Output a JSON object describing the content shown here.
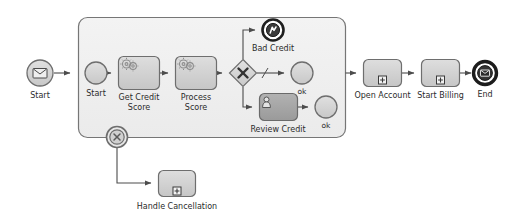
{
  "diagram": {
    "notation": "BPMN",
    "colors": {
      "canvas": "#ffffff",
      "subprocess_fill": "#f0f0f0",
      "task_fill": "#d2d2d2",
      "task_fill_dark": "#a8a8a8",
      "event_fill": "#d4d4d4",
      "stroke": "#6a6a6a",
      "stroke_dark": "#2b2b2b",
      "text": "#2b2b2b",
      "flow": "#5a5a5a"
    }
  },
  "nodes": {
    "start_message": {
      "label": "Start",
      "type": "message-start-event",
      "icon": "envelope-icon",
      "x": 40,
      "y": 73,
      "r": 13
    },
    "subprocess": {
      "label": "",
      "type": "expanded-subprocess",
      "x": 78,
      "y": 17,
      "w": 267,
      "h": 120
    },
    "inner_start": {
      "label": "Start",
      "type": "none-start-event",
      "icon": "circle-icon",
      "x": 96,
      "y": 73,
      "r": 11
    },
    "get_credit_score": {
      "label_line1": "Get Credit",
      "label_line2": "Score",
      "type": "service-task",
      "icon": "gears-icon",
      "x": 118,
      "y": 56,
      "w": 41,
      "h": 34
    },
    "process_score": {
      "label_line1": "Process",
      "label_line2": "Score",
      "type": "service-task",
      "icon": "gears-icon",
      "x": 175,
      "y": 56,
      "w": 41,
      "h": 34
    },
    "gateway": {
      "label": "",
      "type": "exclusive-gateway",
      "icon": "x-icon",
      "x": 243,
      "y": 73,
      "half": 14
    },
    "bad_credit": {
      "label": "Bad Credit",
      "type": "error-end-event",
      "icon": "error-bolt-icon",
      "x": 273,
      "y": 30,
      "r": 11
    },
    "ok_top": {
      "label": "ok",
      "type": "none-end-event",
      "icon": "circle-icon",
      "x": 302,
      "y": 73,
      "r": 11
    },
    "review_credit": {
      "label": "Review Credit",
      "type": "user-task",
      "icon": "user-icon",
      "x": 259,
      "y": 93,
      "w": 38,
      "h": 27
    },
    "ok_bottom": {
      "label": "ok",
      "type": "none-end-event",
      "icon": "circle-icon",
      "x": 326,
      "y": 107,
      "r": 11
    },
    "boundary_cancel": {
      "label": "",
      "type": "cancel-boundary-event",
      "icon": "cancel-x-icon",
      "x": 117,
      "y": 137,
      "r": 11
    },
    "handle_cancellation": {
      "label": "Handle Cancellation",
      "type": "collapsed-subprocess",
      "icon": "plus-marker-icon",
      "x": 158,
      "y": 170,
      "w": 37,
      "h": 27
    },
    "open_account": {
      "label": "Open Account",
      "type": "collapsed-subprocess",
      "icon": "plus-marker-icon",
      "x": 363,
      "y": 59,
      "w": 38,
      "h": 28
    },
    "start_billing": {
      "label": "Start Billing",
      "type": "collapsed-subprocess",
      "icon": "plus-marker-icon",
      "x": 421,
      "y": 59,
      "w": 38,
      "h": 28
    },
    "end_message": {
      "label": "End",
      "type": "message-end-event",
      "icon": "envelope-filled-icon",
      "x": 485,
      "y": 73,
      "r": 12
    }
  },
  "flows": [
    {
      "name": "start-to-subprocess",
      "from": "start_message",
      "to": "subprocess"
    },
    {
      "name": "inner-start-to-get-credit",
      "from": "inner_start",
      "to": "get_credit_score"
    },
    {
      "name": "get-credit-to-process",
      "from": "get_credit_score",
      "to": "process_score"
    },
    {
      "name": "process-to-gateway",
      "from": "process_score",
      "to": "gateway"
    },
    {
      "name": "gateway-to-bad-credit",
      "from": "gateway",
      "to": "bad_credit"
    },
    {
      "name": "gateway-to-ok-top",
      "from": "gateway",
      "to": "ok_top"
    },
    {
      "name": "gateway-to-review-credit",
      "from": "gateway",
      "to": "review_credit"
    },
    {
      "name": "review-credit-to-ok-bottom",
      "from": "review_credit",
      "to": "ok_bottom"
    },
    {
      "name": "subprocess-to-open-account",
      "from": "subprocess",
      "to": "open_account"
    },
    {
      "name": "open-account-to-start-billing",
      "from": "open_account",
      "to": "start_billing"
    },
    {
      "name": "start-billing-to-end",
      "from": "start_billing",
      "to": "end_message"
    },
    {
      "name": "cancel-to-handle",
      "from": "boundary_cancel",
      "to": "handle_cancellation"
    }
  ]
}
